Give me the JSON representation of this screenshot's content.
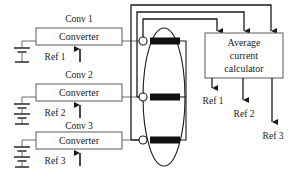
{
  "diagram": {
    "converters": [
      {
        "tag": "Conv 1",
        "box_label": "Converter",
        "ref_label": "Ref 1",
        "source_icon": "battery-icon"
      },
      {
        "tag": "Conv 2",
        "box_label": "Converter",
        "ref_label": "Ref 2",
        "source_icon": "battery-icon"
      },
      {
        "tag": "Conv 3",
        "box_label": "Converter",
        "ref_label": "Ref 3",
        "source_icon": "battery-icon"
      }
    ],
    "calculator": {
      "line1": "Average",
      "line2": "current",
      "line3": "calculator"
    },
    "outputs": [
      {
        "label": "Ref 1"
      },
      {
        "label": "Ref 2"
      },
      {
        "label": "Ref 3"
      }
    ],
    "bus": {
      "shape": "ellipse",
      "loads": [
        "load-bar-1",
        "load-bar-2",
        "load-bar-3"
      ]
    },
    "colors": {
      "line": "#1a1a1a",
      "thin_line": "#6b6b6b",
      "load_fill": "#111111",
      "background": "#ffffff",
      "text": "#1a1a1a"
    }
  }
}
